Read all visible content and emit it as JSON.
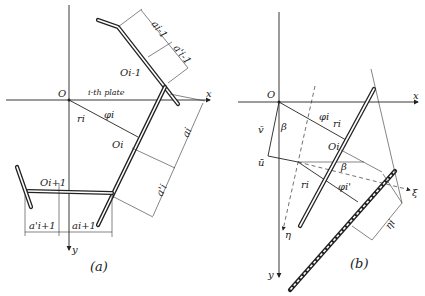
{
  "diagram_a": {
    "caption": "(a)",
    "origin": "O",
    "x_axis": "x",
    "y_axis": "y",
    "plate_label": "i-th plate",
    "angle": "φi",
    "radius": "ri",
    "point_prev": "Oi-1",
    "point_i": "Oi",
    "point_next": "Oi+1",
    "dim_a_prev": "ai-1",
    "dim_a_prime_prev": "a'i-1",
    "dim_a_i": "ai",
    "dim_a_prime_i": "a'i",
    "dim_a_next": "ai+1",
    "dim_a_prime_next": "a'i+1"
  },
  "diagram_b": {
    "caption": "(b)",
    "origin": "O",
    "x_axis": "x",
    "y_axis": "y",
    "angle": "φi",
    "radius": "ri",
    "point_i": "Oi",
    "v_vector": "v̄",
    "u_vector": "ū",
    "beta": "β",
    "beta2": "β",
    "radius2": "ri",
    "angle2": "φi'",
    "xi_axis": "ξ",
    "eta_axis": "η",
    "eta_i": "ηi"
  }
}
